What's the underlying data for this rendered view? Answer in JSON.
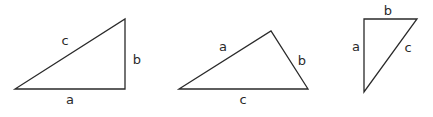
{
  "diagram": {
    "background": "#ffffff",
    "stroke_color": "#2a2a2a",
    "triangles": [
      {
        "name": "right-triangle-1",
        "points": "15,89 125,89 125,19",
        "labels": [
          {
            "text": "c",
            "x": 65,
            "y": 41
          },
          {
            "text": "b",
            "x": 137,
            "y": 60
          },
          {
            "text": "a",
            "x": 70,
            "y": 100
          }
        ]
      },
      {
        "name": "obtuse-triangle",
        "points": "179,89 271,31 308,89",
        "labels": [
          {
            "text": "a",
            "x": 223,
            "y": 47
          },
          {
            "text": "b",
            "x": 302,
            "y": 61
          },
          {
            "text": "c",
            "x": 243,
            "y": 100
          }
        ]
      },
      {
        "name": "right-triangle-2",
        "points": "364,19 417,19 364,92",
        "labels": [
          {
            "text": "b",
            "x": 388,
            "y": 11
          },
          {
            "text": "a",
            "x": 356,
            "y": 47
          },
          {
            "text": "c",
            "x": 408,
            "y": 48
          }
        ]
      }
    ],
    "labels_flat": {
      "t1_c": "c",
      "t1_b": "b",
      "t1_a": "a",
      "t2_a": "a",
      "t2_b": "b",
      "t2_c": "c",
      "t3_b": "b",
      "t3_a": "a",
      "t3_c": "c"
    }
  }
}
